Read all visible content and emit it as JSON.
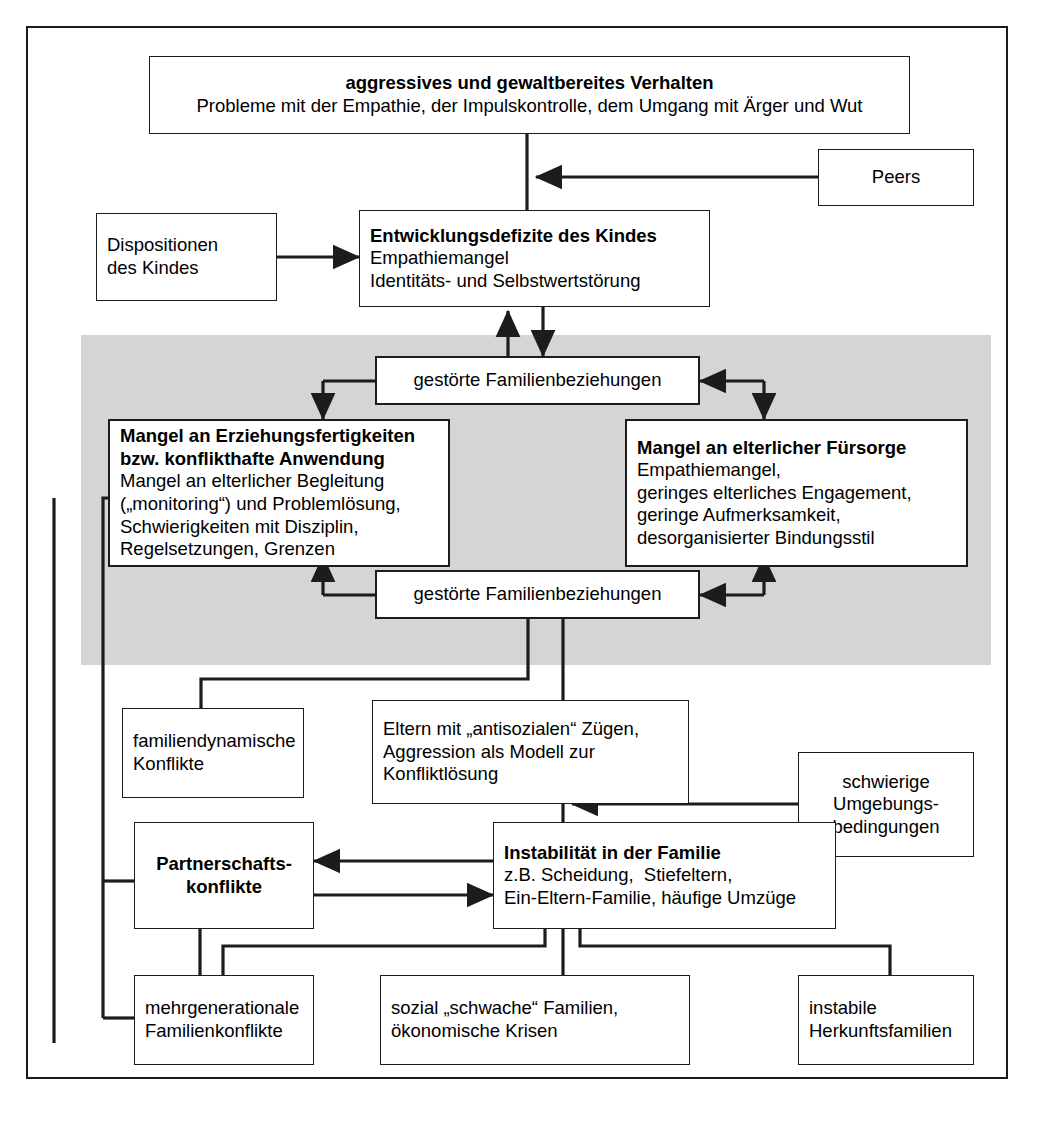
{
  "diagram": {
    "title_region": "Entwicklungsmodell aggressiven Verhaltens",
    "shaded_band_color": "#d5d5d5",
    "line_color": "#1c1c1c",
    "background": "#ffffff"
  },
  "nodes": {
    "aggressives": {
      "lines": [
        {
          "text": "aggressives und gewaltbereites Verhalten",
          "bold": true
        },
        {
          "text": "Probleme mit der Empathie, der Impulskontrolle, dem Umgang mit Ärger und Wut",
          "bold": false
        }
      ]
    },
    "peers": {
      "lines": [
        {
          "text": "Peers",
          "bold": false
        }
      ]
    },
    "dispositionen": {
      "lines": [
        {
          "text": "Dispositionen",
          "bold": false
        },
        {
          "text": "des Kindes",
          "bold": false
        }
      ]
    },
    "entwicklungsdefizite": {
      "lines": [
        {
          "text": "Entwicklungsdefizite des Kindes",
          "bold": true
        },
        {
          "text": "Empathiemangel",
          "bold": false
        },
        {
          "text": "Identitäts- und Selbstwertstörung",
          "bold": false
        }
      ]
    },
    "gestoerte_oben": {
      "lines": [
        {
          "text": "gestörte Familienbeziehungen",
          "bold": false
        }
      ]
    },
    "mangel_erziehung": {
      "lines": [
        {
          "text": "Mangel an Erziehungsfertigkeiten",
          "bold": true
        },
        {
          "text": "bzw. konflikthafte Anwendung",
          "bold": true
        },
        {
          "text": "Mangel an elterlicher Begleitung",
          "bold": false
        },
        {
          "text": "(„monitoring“) und Problemlösung,",
          "bold": false
        },
        {
          "text": "Schwierigkeiten mit Disziplin,",
          "bold": false
        },
        {
          "text": "Regelsetzungen, Grenzen",
          "bold": false
        }
      ]
    },
    "mangel_fuersorge": {
      "lines": [
        {
          "text": "Mangel an elterlicher Fürsorge",
          "bold": true
        },
        {
          "text": "Empathiemangel,",
          "bold": false
        },
        {
          "text": "geringes elterliches Engagement,",
          "bold": false
        },
        {
          "text": "geringe Aufmerksamkeit,",
          "bold": false
        },
        {
          "text": "desorganisierter Bindungsstil",
          "bold": false
        }
      ]
    },
    "gestoerte_unten": {
      "lines": [
        {
          "text": "gestörte Familienbeziehungen",
          "bold": false
        }
      ]
    },
    "familiendynamische": {
      "lines": [
        {
          "text": "familiendynamische",
          "bold": false
        },
        {
          "text": "Konflikte",
          "bold": false
        }
      ]
    },
    "eltern_antisozial": {
      "lines": [
        {
          "text": "Eltern mit „antisozialen“ Zügen,",
          "bold": false
        },
        {
          "text": "Aggression als Modell zur",
          "bold": false
        },
        {
          "text": "Konfliktlösung",
          "bold": false
        }
      ]
    },
    "schwierige_umgebung": {
      "lines": [
        {
          "text": "schwierige",
          "bold": false
        },
        {
          "text": "Umgebungs-",
          "bold": false
        },
        {
          "text": "bedingungen",
          "bold": false
        }
      ]
    },
    "partnerschaftskonflikte": {
      "lines": [
        {
          "text": "Partnerschafts-",
          "bold": true
        },
        {
          "text": "konflikte",
          "bold": true
        }
      ]
    },
    "instabilitaet": {
      "lines": [
        {
          "text": "Instabilität in der Familie",
          "bold": true
        },
        {
          "text": "z.B. Scheidung,  Stiefeltern,",
          "bold": false
        },
        {
          "text": "Ein-Eltern-Familie, häufige Umzüge",
          "bold": false
        }
      ]
    },
    "mehrgenerationale": {
      "lines": [
        {
          "text": "mehrgenerationale",
          "bold": false
        },
        {
          "text": "Familienkonflikte",
          "bold": false
        }
      ]
    },
    "sozial_schwache": {
      "lines": [
        {
          "text": "sozial „schwache“ Familien,",
          "bold": false
        },
        {
          "text": "ökonomische Krisen",
          "bold": false
        }
      ]
    },
    "instabile_herkunft": {
      "lines": [
        {
          "text": "instabile",
          "bold": false
        },
        {
          "text": "Herkunftsfamilien",
          "bold": false
        }
      ]
    }
  },
  "connections": [
    {
      "from": "aggressives",
      "to": "entwicklungsdefizite",
      "type": "line-down"
    },
    {
      "from": "peers",
      "to": "entwicklungsdefizite",
      "type": "arrow-left"
    },
    {
      "from": "dispositionen",
      "to": "entwicklungsdefizite",
      "type": "arrow-right"
    },
    {
      "from": "gestoerte_oben",
      "to": "entwicklungsdefizite",
      "type": "arrow-up"
    },
    {
      "from": "entwicklungsdefizite",
      "to": "gestoerte_oben",
      "type": "arrow-down"
    },
    {
      "from": "gestoerte_oben",
      "to": "mangel_erziehung",
      "type": "elbow-bidirectional"
    },
    {
      "from": "gestoerte_oben",
      "to": "mangel_fuersorge",
      "type": "elbow-bidirectional"
    },
    {
      "from": "gestoerte_unten",
      "to": "mangel_erziehung",
      "type": "elbow-bidirectional"
    },
    {
      "from": "gestoerte_unten",
      "to": "mangel_fuersorge",
      "type": "elbow-bidirectional"
    },
    {
      "from": "gestoerte_unten",
      "to": "familiendynamische",
      "type": "elbow-line"
    },
    {
      "from": "gestoerte_unten",
      "to": "eltern_antisozial",
      "type": "line-down"
    },
    {
      "from": "schwierige_umgebung",
      "to": "instabilitaet",
      "type": "arrow-left"
    },
    {
      "from": "eltern_antisozial",
      "to": "instabilitaet",
      "type": "line-down"
    },
    {
      "from": "instabilitaet",
      "to": "partnerschaftskonflikte",
      "type": "arrow-left"
    },
    {
      "from": "partnerschaftskonflikte",
      "to": "instabilitaet",
      "type": "arrow-right"
    },
    {
      "from": "instabilitaet",
      "to": "sozial_schwache",
      "type": "line-down"
    },
    {
      "from": "instabilitaet",
      "to": "mehrgenerationale",
      "type": "elbow-line"
    },
    {
      "from": "instabilitaet",
      "to": "instabile_herkunft",
      "type": "elbow-line"
    },
    {
      "from": "partnerschaftskonflikte",
      "to": "mehrgenerationale",
      "type": "line-down"
    },
    {
      "from": "mehrgenerationale",
      "to": "mangel_erziehung",
      "type": "feedback-loop-left"
    },
    {
      "from": "partnerschaftskonflikte",
      "to": "mangel_erziehung",
      "type": "feedback-loop-left"
    }
  ]
}
